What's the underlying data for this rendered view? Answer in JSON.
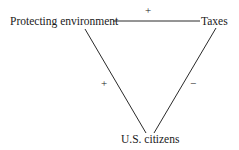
{
  "diagram": {
    "nodes": {
      "protecting_environment": "Protecting environment",
      "taxes": "Taxes",
      "us_citizens": "U.S. citizens"
    },
    "edges": [
      {
        "from": "Protecting environment",
        "to": "Taxes",
        "sign": "+"
      },
      {
        "from": "Protecting environment",
        "to": "U.S. citizens",
        "sign": "+"
      },
      {
        "from": "Taxes",
        "to": "U.S. citizens",
        "sign": "−"
      }
    ],
    "signs": {
      "env_taxes": "+",
      "env_citizens": "+",
      "taxes_citizens": "−"
    },
    "line_color": "#2a2a2a"
  }
}
